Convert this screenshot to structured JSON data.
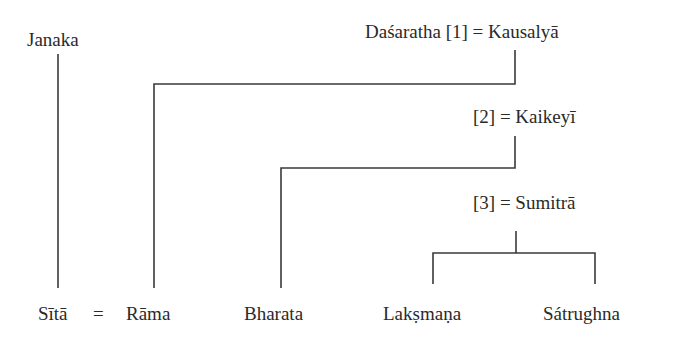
{
  "diagram": {
    "type": "genealogy-tree",
    "ancestors": {
      "janaka": "Janaka",
      "dasaratha_line": "Daśaratha [1] = Kausalyā",
      "wife2_line": "[2] = Kaikeyī",
      "wife3_line": "[3] = Sumitrā"
    },
    "descendants": {
      "sita": "Sītā",
      "marriage_sign": "=",
      "rama": "Rāma",
      "bharata": "Bharata",
      "laksmana": "Lakṣmaṇa",
      "satrughna": "Sátrughna"
    },
    "relations": [
      {
        "parent": "Janaka",
        "child": "Sītā"
      },
      {
        "parent": "Daśaratha [1] = Kausalyā",
        "child": "Rāma"
      },
      {
        "parent": "[2] = Kaikeyī",
        "child": "Bharata"
      },
      {
        "parent": "[3] = Sumitrā",
        "children": [
          "Lakṣmaṇa",
          "Sátrughna"
        ]
      },
      {
        "marriage": [
          "Sītā",
          "Rāma"
        ]
      }
    ]
  }
}
